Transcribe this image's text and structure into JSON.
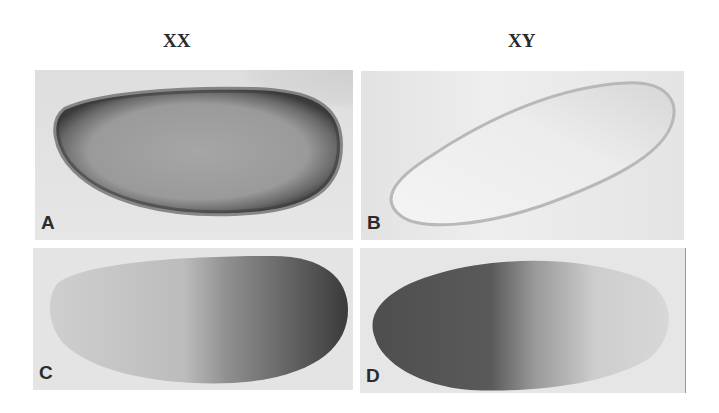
{
  "figure": {
    "column_headers": [
      "XX",
      "XY"
    ],
    "panels": [
      {
        "label": "A",
        "genotype": "XX",
        "staining": "uniform, dark rim"
      },
      {
        "label": "B",
        "genotype": "XY",
        "staining": "faint / absent"
      },
      {
        "label": "C",
        "genotype": "XX",
        "staining": "posterior (right) half"
      },
      {
        "label": "D",
        "genotype": "XY",
        "staining": "anterior (left) half"
      }
    ]
  }
}
